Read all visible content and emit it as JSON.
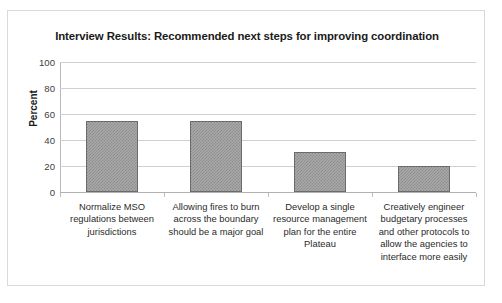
{
  "chart_data": {
    "type": "bar",
    "title": "Interview Results: Recommended next steps for improving coordination",
    "xlabel": "",
    "ylabel": "Percent",
    "ylim": [
      0,
      100
    ],
    "yticks": [
      0,
      20,
      40,
      60,
      80,
      100
    ],
    "ytick_labels": [
      "0",
      "20",
      "40",
      "60",
      "80",
      "100"
    ],
    "grid": true,
    "legend": false,
    "categories": [
      "Normalize MSO regulations between jurisdictions",
      "Allowing fires to burn across the boundary should be a major goal",
      "Develop a single resource management plan for the entire Plateau",
      "Creatively engineer budgetary processes and other protocols to allow the agencies to interface more easily"
    ],
    "values": [
      55,
      55,
      31,
      20
    ],
    "bar_color": "#a8a8a8",
    "bar_pattern": "checkerboard",
    "bar_border_color": "#6b6b6b"
  }
}
